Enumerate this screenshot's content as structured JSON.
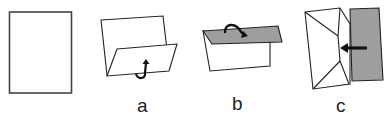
{
  "figure": {
    "type": "paper-folding-steps",
    "panels": [
      {
        "id": "start",
        "label": "",
        "description": "flat sheet"
      },
      {
        "id": "a",
        "label": "a",
        "description": "fold bottom flap up"
      },
      {
        "id": "b",
        "label": "b",
        "description": "fold top flap down (shaded)"
      },
      {
        "id": "c",
        "label": "c",
        "description": "fold right side in (shaded), arrow pointing left"
      }
    ],
    "colors": {
      "stroke": "#333333",
      "shade": "#9e9e9e",
      "paper": "#ffffff",
      "arrow": "#1a1a1a"
    }
  }
}
